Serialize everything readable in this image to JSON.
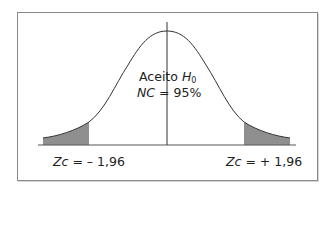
{
  "diagram": {
    "type": "normal-distribution-two-tailed-test",
    "center_label": {
      "line1_text": "Aceito",
      "line1_symbol": "H",
      "line1_subscript": "0",
      "line2_symbol": "NC",
      "line2_text": "= 95%"
    },
    "left_critical": {
      "symbol": "Zc",
      "text": "= – 1,96"
    },
    "right_critical": {
      "symbol": "Zc",
      "text": "= + 1,96"
    },
    "colors": {
      "frame": "#8a8a8a",
      "curve": "#333333",
      "shaded_tail": "#8f8f8f",
      "text": "#222222"
    }
  }
}
